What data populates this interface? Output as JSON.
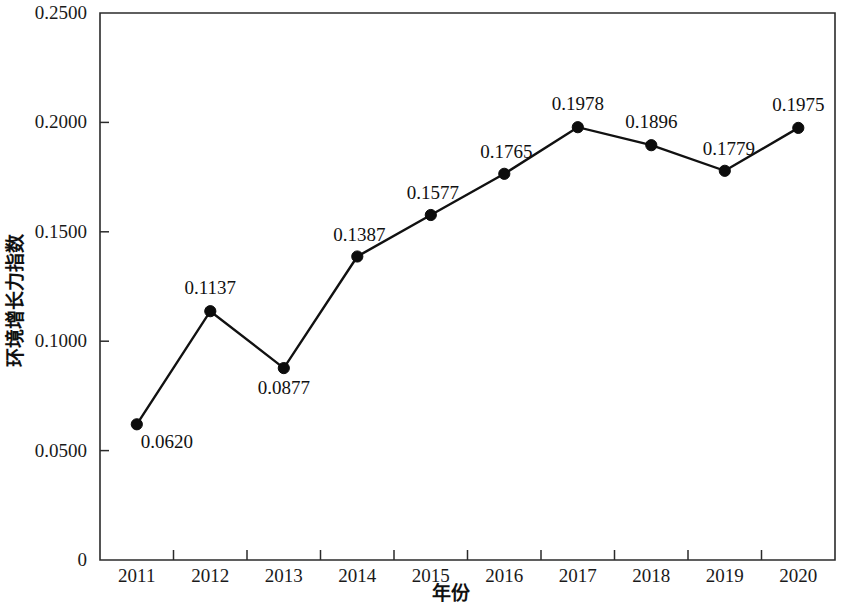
{
  "chart_data": {
    "type": "line",
    "title": "",
    "xlabel": "年份",
    "ylabel": "环境增长力指数",
    "categories": [
      "2011",
      "2012",
      "2013",
      "2014",
      "2015",
      "2016",
      "2017",
      "2018",
      "2019",
      "2020"
    ],
    "values": [
      0.062,
      0.1137,
      0.0877,
      0.1387,
      0.1577,
      0.1765,
      0.1978,
      0.1896,
      0.1779,
      0.1975
    ],
    "point_labels": [
      "0.0620",
      "0.1137",
      "0.0877",
      "0.1387",
      "0.1577",
      "0.1765",
      "0.1978",
      "0.1896",
      "0.1779",
      "0.1975"
    ],
    "label_positions": [
      "below-right",
      "above",
      "below",
      "above-left",
      "above-left",
      "above-left",
      "above",
      "above",
      "above-right",
      "above"
    ],
    "ylim": [
      0,
      0.25
    ],
    "y_ticks": [
      0,
      0.05,
      0.1,
      0.15,
      0.2,
      0.25
    ],
    "y_tick_labels": [
      "0",
      "0.0500",
      "0.1000",
      "0.1500",
      "0.2000",
      "0.2500"
    ],
    "grid": false,
    "legend": null,
    "series_color": "#111111",
    "marker": "circle",
    "marker_color": "#0c0c0c",
    "frame_color": "#2b2b2b",
    "background": "#ffffff"
  },
  "axes": {
    "y_axis_name": "y-axis",
    "x_axis_name": "x-axis"
  }
}
